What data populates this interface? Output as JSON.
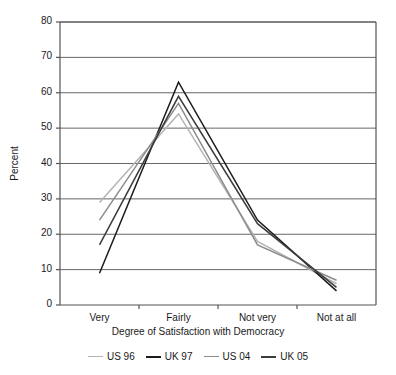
{
  "chart_data": {
    "type": "line",
    "title": "",
    "xlabel": "Degree of Satisfaction with Democracy",
    "ylabel": "Percent",
    "categories": [
      "Very",
      "Fairly",
      "Not very",
      "Not at all"
    ],
    "ylim": [
      0,
      80
    ],
    "yticks": [
      0,
      10,
      20,
      30,
      40,
      50,
      60,
      70,
      80
    ],
    "ytick_labels": [
      "0",
      "10",
      "20",
      "30",
      "40",
      "50",
      "60",
      "70",
      "80"
    ],
    "grid": "horizontal",
    "legend_position": "bottom",
    "series": [
      {
        "name": "US 96",
        "values": [
          29,
          54,
          18,
          6
        ],
        "color": "#b4b4b4"
      },
      {
        "name": "UK 97",
        "values": [
          9,
          63,
          24,
          4
        ],
        "color": "#1c1c1c"
      },
      {
        "name": "US 04",
        "values": [
          24,
          57,
          17,
          7
        ],
        "color": "#8c8c8c"
      },
      {
        "name": "UK 05",
        "values": [
          17,
          59,
          23,
          5
        ],
        "color": "#3c3c3c"
      }
    ]
  },
  "axis": {
    "ytick_labels": [
      "80",
      "70",
      "60",
      "50",
      "40",
      "30",
      "20",
      "10",
      "0"
    ],
    "xtick_labels": [
      "Very",
      "Fairly",
      "Not very",
      "Not at all"
    ],
    "xtitle": "Degree of Satisfaction with Democracy",
    "ytitle": "Percent"
  },
  "legend": {
    "items": [
      {
        "label": "US 96"
      },
      {
        "label": "UK 97"
      },
      {
        "label": "US 04"
      },
      {
        "label": "UK 05"
      }
    ]
  },
  "style": {
    "frame_color": "#555555",
    "grid_color": "#666666",
    "background": "#ffffff"
  }
}
